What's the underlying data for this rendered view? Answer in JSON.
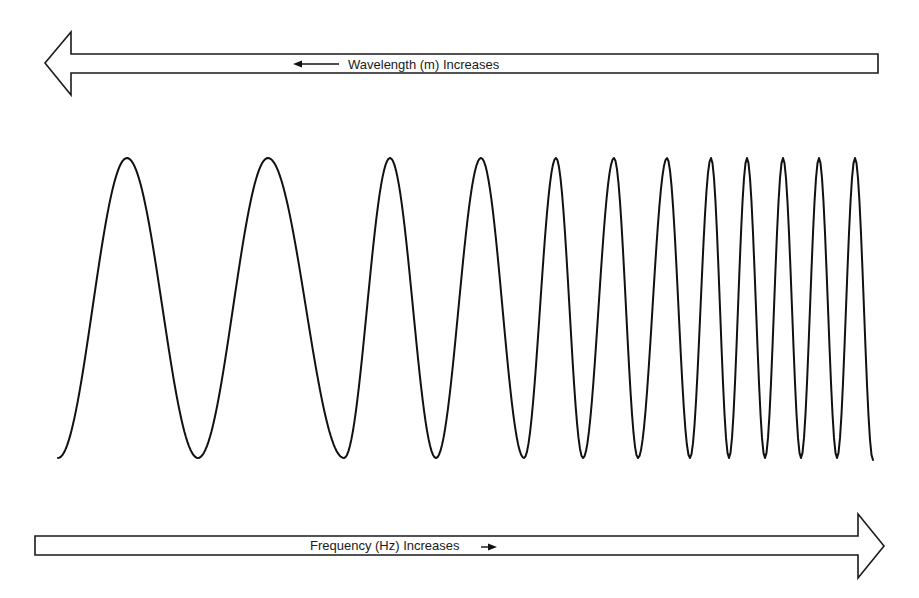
{
  "diagram": {
    "top_arrow": {
      "direction": "left",
      "label": "Wavelength (m) Increases",
      "inner_arrow_direction": "left"
    },
    "bottom_arrow": {
      "direction": "right",
      "label": "Frequency (Hz) Increases",
      "inner_arrow_direction": "right"
    },
    "wave": {
      "description": "Sine wave whose wavelength decreases (frequency increases) from left to right",
      "peak_count": 12,
      "trough_count": 11,
      "peak_x": [
        127,
        268,
        390,
        481,
        556,
        614,
        667,
        711,
        747,
        783,
        819,
        855
      ],
      "trough_x": [
        198,
        344,
        436,
        524,
        583,
        638,
        690,
        729,
        765,
        801,
        837
      ],
      "peak_y": 158,
      "trough_y": 458,
      "start": [
        58,
        458
      ],
      "end": [
        873,
        460
      ]
    },
    "colors": {
      "line": "#111111",
      "background": "#ffffff"
    }
  }
}
